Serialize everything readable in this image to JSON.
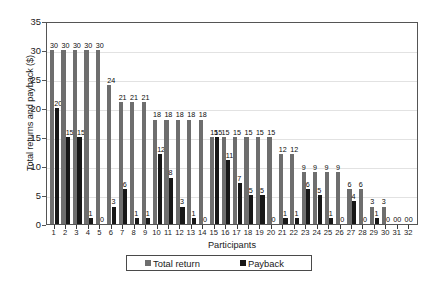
{
  "chart_data": {
    "type": "bar",
    "title": "",
    "xlabel": "Participants",
    "ylabel": "Total returns and payback ($)",
    "ylim": [
      0,
      35
    ],
    "ytick_step": 5,
    "yticks": [
      0,
      5,
      10,
      15,
      20,
      25,
      30,
      35
    ],
    "grid": true,
    "legend_position": "bottom",
    "categories": [
      "1",
      "2",
      "3",
      "4",
      "5",
      "6",
      "7",
      "8",
      "9",
      "10",
      "11",
      "12",
      "13",
      "14",
      "15",
      "16",
      "17",
      "18",
      "19",
      "20",
      "21",
      "22",
      "23",
      "24",
      "25",
      "26",
      "27",
      "28",
      "29",
      "30",
      "31",
      "32"
    ],
    "series": [
      {
        "name": "Total return",
        "color": "#6e6e6e",
        "values": [
          30,
          30,
          30,
          30,
          30,
          24,
          21,
          21,
          21,
          18,
          18,
          18,
          18,
          18,
          15,
          15,
          15,
          15,
          15,
          15,
          12,
          12,
          9,
          9,
          9,
          9,
          6,
          6,
          3,
          3,
          0,
          0
        ]
      },
      {
        "name": "Payback",
        "color": "#171717",
        "values": [
          20,
          15,
          15,
          1,
          0,
          3,
          6,
          1,
          1,
          12,
          8,
          3,
          1,
          0,
          15,
          11,
          7,
          5,
          5,
          0,
          1,
          1,
          6,
          5,
          1,
          0,
          4,
          0,
          1,
          0,
          0,
          0
        ]
      }
    ]
  },
  "legend": {
    "items": [
      {
        "label": "Total return",
        "swatch": "legend-swatch-total-return"
      },
      {
        "label": "Payback",
        "swatch": "legend-swatch-payback"
      }
    ]
  },
  "axes": {
    "y_title": "Total returns and payback ($)",
    "x_title": "Participants"
  }
}
